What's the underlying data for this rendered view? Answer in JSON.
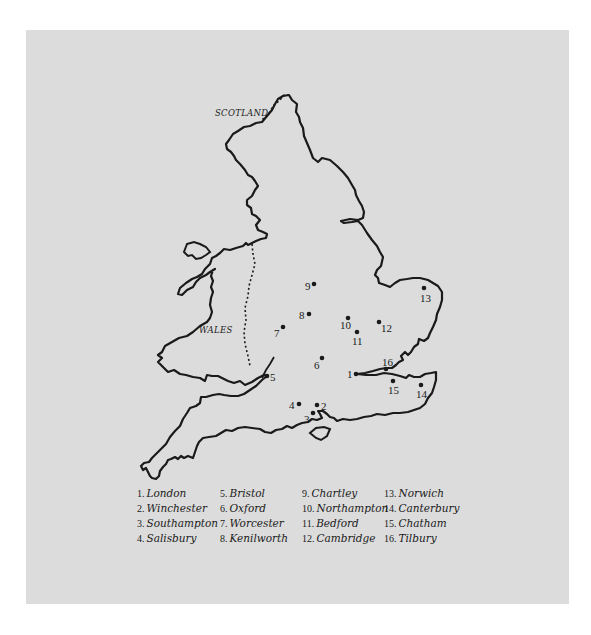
{
  "map": {
    "regions": [
      {
        "label": "SCOTLAND",
        "x": 215,
        "y": 116
      },
      {
        "label": "WALES",
        "x": 199,
        "y": 333
      }
    ],
    "locations": [
      {
        "num": "1",
        "name": "London",
        "x": 356,
        "y": 374,
        "lx": 347,
        "ly": 378
      },
      {
        "num": "2",
        "name": "Winchester",
        "x": 317,
        "y": 405,
        "lx": 321,
        "ly": 410
      },
      {
        "num": "3",
        "name": "Southampton",
        "x": 313,
        "y": 413,
        "lx": 304,
        "ly": 423
      },
      {
        "num": "4",
        "name": "Salisbury",
        "x": 299,
        "y": 404,
        "lx": 289,
        "ly": 409
      },
      {
        "num": "5",
        "name": "Bristol",
        "x": 267,
        "y": 376,
        "lx": 270,
        "ly": 381
      },
      {
        "num": "6",
        "name": "Oxford",
        "x": 322,
        "y": 358,
        "lx": 314,
        "ly": 369
      },
      {
        "num": "7",
        "name": "Worcester",
        "x": 283,
        "y": 327,
        "lx": 274,
        "ly": 337
      },
      {
        "num": "8",
        "name": "Kenilworth",
        "x": 309,
        "y": 314,
        "lx": 299,
        "ly": 319
      },
      {
        "num": "9",
        "name": "Chartley",
        "x": 314,
        "y": 284,
        "lx": 305,
        "ly": 290
      },
      {
        "num": "10",
        "name": "Northampton",
        "x": 348,
        "y": 318,
        "lx": 340,
        "ly": 329
      },
      {
        "num": "11",
        "name": "Bedford",
        "x": 357,
        "y": 332,
        "lx": 352,
        "ly": 345
      },
      {
        "num": "12",
        "name": "Cambridge",
        "x": 379,
        "y": 322,
        "lx": 381,
        "ly": 332
      },
      {
        "num": "13",
        "name": "Norwich",
        "x": 424,
        "y": 288,
        "lx": 420,
        "ly": 302
      },
      {
        "num": "14",
        "name": "Canterbury",
        "x": 421,
        "y": 385,
        "lx": 416,
        "ly": 398
      },
      {
        "num": "15",
        "name": "Chatham",
        "x": 393,
        "y": 381,
        "lx": 388,
        "ly": 394
      },
      {
        "num": "16",
        "name": "Tilbury",
        "x": 386,
        "y": 369,
        "lx": 382,
        "ly": 366
      }
    ]
  },
  "legend": {
    "columns": [
      [
        {
          "num": "1.",
          "name": "London"
        },
        {
          "num": "2.",
          "name": "Winchester"
        },
        {
          "num": "3.",
          "name": "Southampton"
        },
        {
          "num": "4.",
          "name": "Salisbury"
        }
      ],
      [
        {
          "num": "5.",
          "name": "Bristol"
        },
        {
          "num": "6.",
          "name": "Oxford"
        },
        {
          "num": "7.",
          "name": "Worcester"
        },
        {
          "num": "8.",
          "name": "Kenilworth"
        }
      ],
      [
        {
          "num": "9.",
          "name": "Chartley"
        },
        {
          "num": "10.",
          "name": "Northampton"
        },
        {
          "num": "11.",
          "name": "Bedford"
        },
        {
          "num": "12.",
          "name": "Cambridge"
        }
      ],
      [
        {
          "num": "13.",
          "name": "Norwich"
        },
        {
          "num": "14.",
          "name": "Canterbury"
        },
        {
          "num": "15.",
          "name": "Chatham"
        },
        {
          "num": "16.",
          "name": "Tilbury"
        }
      ]
    ]
  },
  "colors": {
    "background": "#ffffff",
    "panel": "#dcdcdc",
    "ink": "#1a1a1a"
  }
}
